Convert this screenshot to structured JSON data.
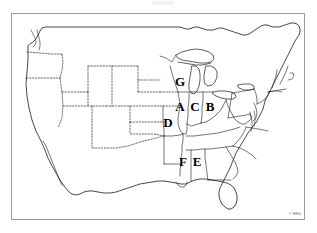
{
  "figure": {
    "kind": "blank-outline-map",
    "region": "United States (contiguous 48 states)",
    "projection_note": "conic, continental United States",
    "background_color": "#ffffff",
    "line_color": "#000000",
    "frame_color": "#9a9a9a",
    "label_color": "#000000"
  },
  "frame": {
    "x": 11,
    "y": 13,
    "width": 294,
    "height": 207,
    "border_width": 1
  },
  "labels": [
    {
      "id": "label-a",
      "text": "A",
      "x": 180,
      "y": 106,
      "state": "Illinois"
    },
    {
      "id": "label-b",
      "text": "B",
      "x": 210,
      "y": 106,
      "state": "Ohio"
    },
    {
      "id": "label-c",
      "text": "C",
      "x": 195,
      "y": 106,
      "state": "Indiana"
    },
    {
      "id": "label-d",
      "text": "D",
      "x": 168,
      "y": 122,
      "state": "Missouri"
    },
    {
      "id": "label-e",
      "text": "E",
      "x": 197,
      "y": 161,
      "state": "Alabama"
    },
    {
      "id": "label-f",
      "text": "F",
      "x": 183,
      "y": 161,
      "state": "Mississippi"
    },
    {
      "id": "label-g",
      "text": "G",
      "x": 180,
      "y": 81,
      "state": "Wisconsin"
    }
  ],
  "legend_letters": [
    "A",
    "B",
    "C",
    "D",
    "E",
    "F",
    "G"
  ],
  "copyright": {
    "text": "© HRG",
    "position": "bottom-right"
  }
}
